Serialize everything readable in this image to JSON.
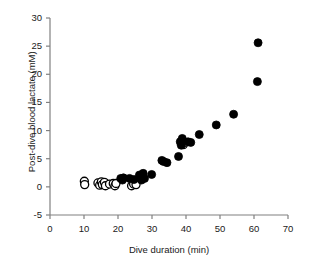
{
  "chart_data": {
    "type": "scatter",
    "title": "",
    "xlabel": "Dive duration (min)",
    "ylabel": "Post-dive blood lactate (mM)",
    "xlim": [
      0,
      70
    ],
    "ylim": [
      -5,
      30
    ],
    "xticks": [
      0,
      10,
      20,
      30,
      40,
      50,
      60,
      70
    ],
    "yticks": [
      -5,
      0,
      5,
      10,
      15,
      20,
      25,
      30
    ],
    "xtick_labels": [
      "0",
      "10",
      "20",
      "30",
      "40",
      "50",
      "60",
      "70"
    ],
    "ytick_labels": [
      "-5",
      "0",
      "5",
      "10",
      "15",
      "20",
      "25",
      "30"
    ],
    "grid": false,
    "legend": null,
    "legend_position": "none",
    "axis_color": "#808080",
    "marker_color": "#000000",
    "series": [
      {
        "name": "open-circles",
        "marker": "open-circle",
        "fill": "#ffffff",
        "edge": "#000000",
        "points": [
          [
            10.1,
            1.0
          ],
          [
            10.2,
            0.4
          ],
          [
            14.1,
            0.7
          ],
          [
            14.6,
            0.3
          ],
          [
            15.1,
            0.9
          ],
          [
            15.4,
            0.4
          ],
          [
            16.0,
            0.8
          ],
          [
            16.3,
            0.2
          ],
          [
            17.5,
            0.5
          ],
          [
            18.6,
            0.6
          ],
          [
            19.1,
            0.2
          ],
          [
            19.4,
            0.6
          ],
          [
            24.0,
            0.2
          ],
          [
            24.6,
            0.5
          ],
          [
            25.3,
            0.4
          ],
          [
            39.2,
            7.5
          ],
          [
            39.6,
            7.9
          ]
        ]
      },
      {
        "name": "filled-circles",
        "marker": "filled-circle",
        "fill": "#000000",
        "edge": "#000000",
        "points": [
          [
            20.8,
            1.5
          ],
          [
            21.3,
            1.2
          ],
          [
            21.6,
            1.6
          ],
          [
            23.4,
            1.5
          ],
          [
            24.7,
            1.3
          ],
          [
            26.3,
            2.1
          ],
          [
            26.9,
            1.2
          ],
          [
            27.4,
            2.4
          ],
          [
            27.8,
            1.5
          ],
          [
            29.9,
            2.2
          ],
          [
            32.9,
            4.7
          ],
          [
            33.4,
            4.5
          ],
          [
            34.4,
            4.3
          ],
          [
            37.8,
            5.4
          ],
          [
            38.3,
            8.0
          ],
          [
            38.6,
            7.4
          ],
          [
            38.9,
            8.6
          ],
          [
            40.6,
            8.0
          ],
          [
            41.4,
            7.9
          ],
          [
            43.9,
            9.3
          ],
          [
            48.9,
            11.0
          ],
          [
            54.0,
            12.9
          ],
          [
            61.0,
            18.7
          ],
          [
            61.2,
            25.6
          ]
        ]
      }
    ]
  }
}
